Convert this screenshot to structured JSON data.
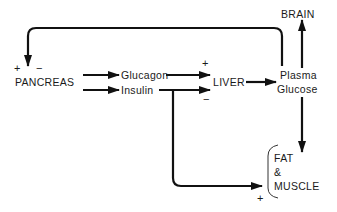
{
  "diagram": {
    "type": "flow-diagram",
    "nodes": {
      "pancreas": "PANCREAS",
      "glucagon": "Glucagon",
      "insulin": "Insulin",
      "liver": "LIVER",
      "plasma": "Plasma",
      "glucose": "Glucose",
      "brain": "BRAIN",
      "fat": "FAT",
      "amp": "&",
      "muscle": "MUSCLE"
    },
    "signs": {
      "pancreas_plus": "+",
      "pancreas_minus": "−",
      "glucagon_liver": "+",
      "insulin_liver": "−",
      "insulin_fat_muscle": "+"
    },
    "edges": [
      {
        "from": "PANCREAS",
        "to": "Glucagon"
      },
      {
        "from": "PANCREAS",
        "to": "Insulin"
      },
      {
        "from": "Glucagon",
        "to": "LIVER",
        "sign": "+"
      },
      {
        "from": "Insulin",
        "to": "LIVER",
        "sign": "−"
      },
      {
        "from": "Insulin",
        "to": "FAT & MUSCLE",
        "sign": "+"
      },
      {
        "from": "LIVER",
        "to": "Plasma Glucose"
      },
      {
        "from": "Plasma Glucose",
        "to": "BRAIN"
      },
      {
        "from": "Plasma Glucose",
        "to": "FAT & MUSCLE"
      },
      {
        "from": "Plasma Glucose",
        "to": "PANCREAS",
        "sign": "+ / −",
        "type": "feedback"
      }
    ],
    "colors": {
      "line": "#111111",
      "text": "#1a1a1a",
      "background": "#ffffff"
    }
  }
}
